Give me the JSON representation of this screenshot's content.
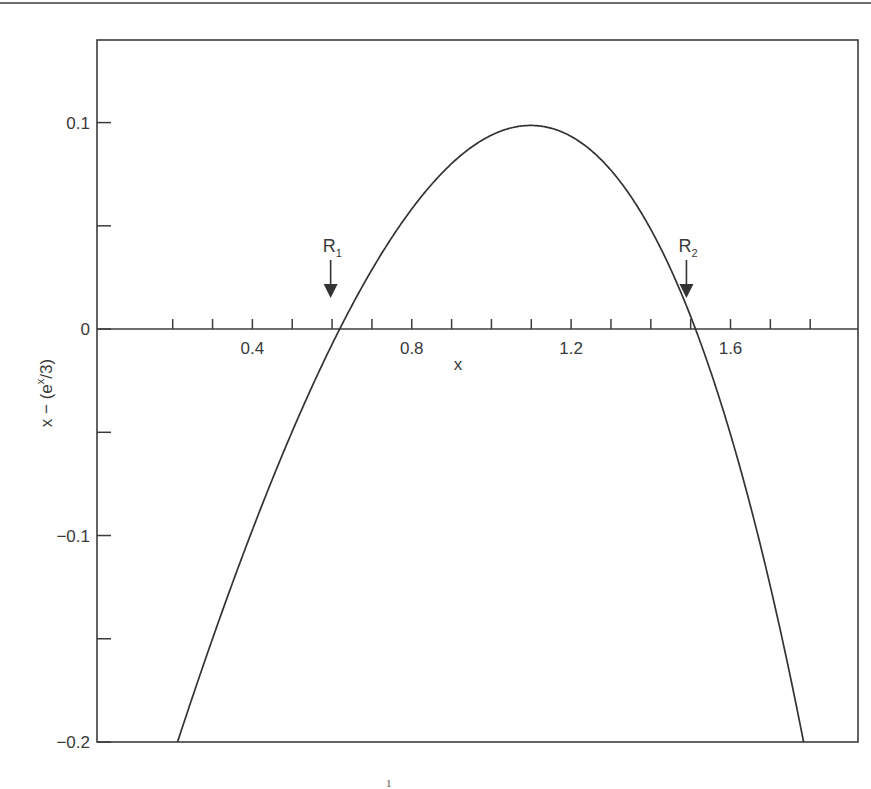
{
  "chart_data": {
    "type": "line",
    "title": "",
    "function": "x - (e^x/3)",
    "xlabel": "x",
    "ylabel": "x − (e^x/3)",
    "ylabel_parts": {
      "pre": "x − (e",
      "sup": "x",
      "post": "/3)"
    },
    "xlim": [
      0.01,
      1.92
    ],
    "ylim": [
      -0.2,
      0.14
    ],
    "x_ticks": [
      0.2,
      0.3,
      0.4,
      0.5,
      0.6,
      0.7,
      0.8,
      0.9,
      1.0,
      1.1,
      1.2,
      1.3,
      1.4,
      1.5,
      1.6,
      1.7,
      1.8
    ],
    "x_tick_labels": [
      {
        "value": 0.4,
        "label": "0.4"
      },
      {
        "value": 0.8,
        "label": "0.8"
      },
      {
        "value": 1.2,
        "label": "1.2"
      },
      {
        "value": 1.6,
        "label": "1.6"
      }
    ],
    "y_ticks": [
      0.1,
      0.05,
      0,
      -0.05,
      -0.1,
      -0.15,
      -0.2
    ],
    "y_tick_labels": [
      {
        "value": 0.1,
        "label": "0.1"
      },
      {
        "value": 0,
        "label": "0"
      },
      {
        "value": -0.1,
        "label": "−0.1"
      },
      {
        "value": -0.2,
        "label": "−0.2"
      }
    ],
    "grid": false,
    "series": [
      {
        "name": "x - e^x/3",
        "x": [
          0.2,
          0.3,
          0.4,
          0.5,
          0.6,
          0.7,
          0.8,
          0.9,
          1.0,
          1.1,
          1.2,
          1.3,
          1.4,
          1.5,
          1.6,
          1.7,
          1.8
        ],
        "y": [
          -0.207,
          -0.15,
          -0.097,
          -0.05,
          -0.007,
          0.029,
          0.058,
          0.08,
          0.094,
          0.099,
          0.094,
          0.077,
          0.045,
          0.006,
          -0.065,
          -0.158,
          -0.215
        ]
      }
    ],
    "annotations": [
      {
        "label": "R",
        "subscript": "1",
        "x": 0.619,
        "y": 0
      },
      {
        "label": "R",
        "subscript": "2",
        "x": 1.512,
        "y": 0
      }
    ],
    "legend": "none"
  },
  "footnote": "1"
}
